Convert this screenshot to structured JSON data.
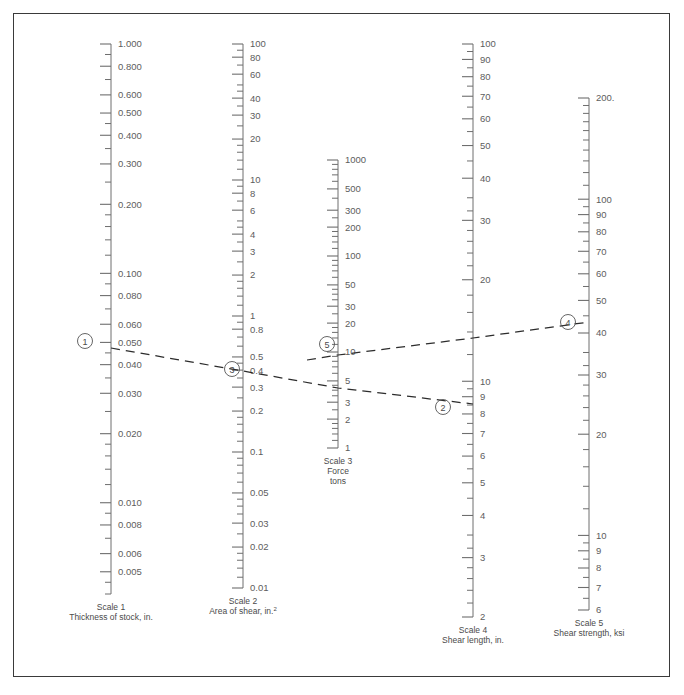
{
  "figure": {
    "kind": "nomogram",
    "border_color": "#3a3a3a",
    "background": "#ffffff",
    "axis_color": "#6e6e6e",
    "line_color": "#2c2c2c"
  },
  "chart_data": {
    "type": "line",
    "xlabel": "",
    "ylabel": "",
    "grid": false,
    "legend": "none",
    "scales": [
      {
        "id": "scale1",
        "name": "Scale 1",
        "caption_line1": "Scale 1",
        "caption_line2": "Thickness of stock, in.",
        "axis": "log",
        "x": 111,
        "y_top": 44,
        "y_bottom": 594,
        "value_top": 1.0,
        "value_bottom": 0.004,
        "labels": [
          "1.000",
          "0.800",
          "0.600",
          "0.500",
          "0.400",
          "0.300",
          "0.200",
          "0.100",
          "0.080",
          "0.060",
          "0.050",
          "0.040",
          "0.030",
          "0.020",
          "0.010",
          "0.008",
          "0.006",
          "0.005"
        ],
        "label_values": [
          1.0,
          0.8,
          0.6,
          0.5,
          0.4,
          0.3,
          0.2,
          0.1,
          0.08,
          0.06,
          0.05,
          0.04,
          0.03,
          0.02,
          0.01,
          0.008,
          0.006,
          0.005
        ],
        "minor_values": [
          0.9,
          0.7,
          0.45,
          0.35,
          0.25,
          0.18,
          0.16,
          0.14,
          0.12,
          0.09,
          0.07,
          0.045,
          0.035,
          0.025,
          0.018,
          0.016,
          0.014,
          0.012,
          0.009,
          0.007,
          0.0045,
          0.004
        ]
      },
      {
        "id": "scale2",
        "name": "Scale 2",
        "caption_line1": "Scale 2",
        "caption_line2": "Area of shear, in.²",
        "axis": "log",
        "x": 243,
        "y_top": 44,
        "y_bottom": 588,
        "value_top": 100,
        "value_bottom": 0.01,
        "labels": [
          "100",
          "80",
          "60",
          "40",
          "30",
          "20",
          "10",
          "8",
          "6",
          "4",
          "3",
          "2",
          "1",
          "0.8",
          "0.5",
          "0.4",
          "0.3",
          "0.2",
          "0.1",
          "0.05",
          "0.03",
          "0.02",
          "0.01"
        ],
        "label_values": [
          100,
          80,
          60,
          40,
          30,
          20,
          10,
          8,
          6,
          4,
          3,
          2,
          1,
          0.8,
          0.5,
          0.4,
          0.3,
          0.2,
          0.1,
          0.05,
          0.03,
          0.02,
          0.01
        ],
        "minor_values": [
          90,
          70,
          50,
          45,
          35,
          25,
          18,
          16,
          14,
          12,
          9,
          7,
          5,
          4.5,
          3.5,
          2.5,
          1.8,
          1.6,
          1.4,
          1.2,
          0.9,
          0.7,
          0.6,
          0.45,
          0.35,
          0.25,
          0.18,
          0.16,
          0.14,
          0.12,
          0.09,
          0.08,
          0.07,
          0.06,
          0.045,
          0.04,
          0.035,
          0.025,
          0.018,
          0.016,
          0.014,
          0.012
        ]
      },
      {
        "id": "scale3",
        "name": "Scale 3",
        "caption_line1": "Scale 3",
        "caption_line2": "Force",
        "caption_line3": "tons",
        "axis": "log",
        "x": 338,
        "y_top": 160,
        "y_bottom": 448,
        "value_top": 1000,
        "value_bottom": 1,
        "labels": [
          "1000",
          "500",
          "300",
          "200",
          "100",
          "50",
          "30",
          "20",
          "10",
          "5",
          "3",
          "2",
          "1"
        ],
        "label_values": [
          1000,
          500,
          300,
          200,
          100,
          50,
          30,
          20,
          10,
          5,
          3,
          2,
          1
        ],
        "minor_values": [
          900,
          800,
          700,
          600,
          400,
          250,
          180,
          160,
          140,
          120,
          90,
          80,
          70,
          60,
          45,
          40,
          35,
          25,
          18,
          16,
          14,
          12,
          9,
          8,
          7,
          6,
          4.5,
          4,
          3.5,
          2.5,
          1.8,
          1.6,
          1.4,
          1.2
        ]
      },
      {
        "id": "scale4",
        "name": "Scale 4",
        "caption_line1": "Scale 4",
        "caption_line2": "Shear length, in.",
        "axis": "log",
        "x": 473,
        "y_top": 44,
        "y_bottom": 617,
        "value_top": 100,
        "value_bottom": 2,
        "labels": [
          "100",
          "90",
          "80",
          "70",
          "60",
          "50",
          "40",
          "30",
          "20",
          "10",
          "9",
          "8",
          "7",
          "6",
          "5",
          "4",
          "3",
          "2"
        ],
        "label_values": [
          100,
          90,
          80,
          70,
          60,
          50,
          40,
          30,
          20,
          10,
          9,
          8,
          7,
          6,
          5,
          4,
          3,
          2
        ],
        "minor_values": [
          95,
          85,
          75,
          65,
          55,
          45,
          35,
          32,
          28,
          26,
          24,
          22,
          18,
          16,
          14,
          12,
          9.5,
          8.5,
          7.5,
          6.5,
          5.5,
          4.5,
          3.5,
          3.2,
          2.8,
          2.6,
          2.4,
          2.2
        ]
      },
      {
        "id": "scale5",
        "name": "Scale 5",
        "caption_line1": "Scale 5",
        "caption_line2": "Shear strength, ksi",
        "axis": "log",
        "x": 589,
        "y_top": 98,
        "y_bottom": 610,
        "value_top": 200,
        "value_bottom": 6,
        "labels": [
          "200.",
          "100",
          "90",
          "80",
          "70",
          "60",
          "50",
          "40",
          "30",
          "20",
          "10",
          "9",
          "8",
          "7",
          "6"
        ],
        "label_values": [
          200,
          100,
          90,
          80,
          70,
          60,
          50,
          40,
          30,
          20,
          10,
          9,
          8,
          7,
          6
        ],
        "minor_values": [
          190,
          180,
          170,
          160,
          150,
          140,
          130,
          120,
          110,
          95,
          85,
          75,
          65,
          55,
          45,
          35,
          32,
          28,
          26,
          24,
          22,
          18,
          16,
          14,
          12,
          9.5,
          8.5,
          7.5,
          6.5
        ]
      }
    ],
    "markers": [
      {
        "label": "1",
        "scale": "scale1",
        "value": 0.05,
        "x": 85,
        "y": 341,
        "cx": 85,
        "cy": 341
      },
      {
        "label": "3",
        "scale": "scale2",
        "value": 0.47,
        "x": 232,
        "y": 369,
        "cx": 232,
        "cy": 369
      },
      {
        "label": "5",
        "scale": "scale3",
        "value": 11,
        "x": 327,
        "y": 344,
        "cx": 327,
        "cy": 344
      },
      {
        "label": "2",
        "scale": "scale4",
        "value": 9.3,
        "x": 443,
        "y": 407,
        "cx": 443,
        "cy": 407
      },
      {
        "label": "4",
        "scale": "scale5",
        "value": 42,
        "x": 568,
        "y": 322,
        "cx": 568,
        "cy": 322
      }
    ],
    "isopleths": [
      {
        "name": "thickness-length-area",
        "from": "scale1",
        "to": "scale4",
        "points": [
          [
            111,
            348
          ],
          [
            243,
            371
          ],
          [
            338,
            388
          ],
          [
            473,
            404
          ]
        ]
      },
      {
        "name": "area-strength-force",
        "from": "scale3",
        "to": "scale5",
        "points": [
          [
            307,
            360
          ],
          [
            338,
            355
          ],
          [
            473,
            338
          ],
          [
            589,
            322
          ]
        ]
      }
    ]
  }
}
